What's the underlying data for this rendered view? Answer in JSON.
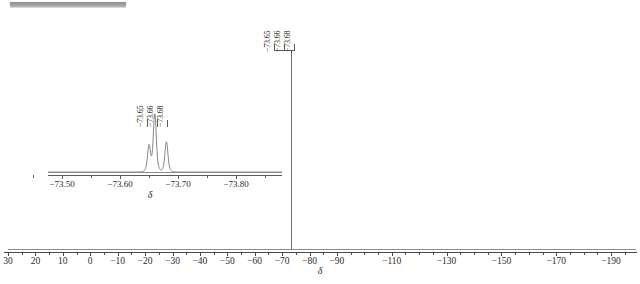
{
  "figure": {
    "kind": "nmr-spectrum",
    "top_strip": {
      "name": "scrollbar-strip",
      "color": "#9a9a9a"
    }
  },
  "chart_data": {
    "type": "line",
    "title": "",
    "xlabel": "δ",
    "ylabel": "",
    "xlim": [
      30,
      -198
    ],
    "grid": false,
    "legend_position": "none",
    "axis_direction": "decreasing",
    "annotations": [
      "-73.65",
      "-73.66",
      "-73.68"
    ],
    "main": {
      "axis_label": "δ",
      "tick_values": [
        30,
        20,
        10,
        0,
        -10,
        -20,
        -30,
        -40,
        -50,
        -60,
        -70,
        -80,
        -90,
        -110,
        -130,
        -150,
        -170,
        -190
      ],
      "tick_labels": [
        "30",
        "20",
        "10",
        "0",
        "−10",
        "−20",
        "−30",
        "−40",
        "−50",
        "−60",
        "−70",
        "−80",
        "−90",
        "−110",
        "−130",
        "−150",
        "−170",
        "−190"
      ],
      "minor_tick_values": [
        25,
        15,
        5,
        -5,
        -15,
        -25,
        -35,
        -45,
        -55,
        -65,
        -75,
        -85,
        -95,
        -100,
        -105,
        -115,
        -120,
        -125,
        -135,
        -140,
        -145,
        -155,
        -160,
        -165,
        -175,
        -180,
        -185,
        -195
      ],
      "peaks": [
        {
          "shift": -73.7,
          "relative_height": 1.0
        }
      ],
      "annotation_labels": [
        "−73.65",
        "−73.66",
        "−73.68"
      ]
    },
    "inset": {
      "axis_label": "δ",
      "xlim": [
        -73.45,
        -73.86
      ],
      "tick_values": [
        -73.5,
        -73.6,
        -73.7,
        -73.8
      ],
      "tick_labels": [
        "−73.50",
        "−73.60",
        "−73.70",
        "−73.80"
      ],
      "minor_tick_values": [
        -73.45,
        -73.55,
        -73.65,
        -73.75,
        -73.85
      ],
      "annotation_labels": [
        "−73.65",
        "−73.66",
        "−73.68"
      ],
      "peaks": [
        {
          "shift": -73.65,
          "relative_height": 0.45
        },
        {
          "shift": -73.66,
          "relative_height": 1.0
        },
        {
          "shift": -73.68,
          "relative_height": 0.52
        }
      ]
    }
  }
}
